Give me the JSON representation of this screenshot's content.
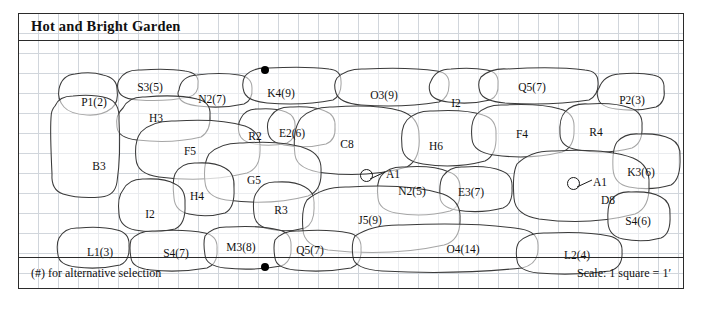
{
  "plan": {
    "title": "Hot and Bright Garden",
    "footer_note": "(#) for alternative selection",
    "footer_scale": "Scale: 1 square = 1′",
    "grid_square_px": 20,
    "border_color": "#2b2b2b",
    "grid_color": "#c9cfd6"
  },
  "beds": [
    {
      "label": "P1(2)",
      "cx": 75,
      "cy": 88
    },
    {
      "label": "S3(5)",
      "cx": 131,
      "cy": 73
    },
    {
      "label": "N2(7)",
      "cx": 193,
      "cy": 85
    },
    {
      "label": "K4(9)",
      "cx": 262,
      "cy": 79
    },
    {
      "label": "O3(9)",
      "cx": 365,
      "cy": 81
    },
    {
      "label": "I2",
      "cx": 437,
      "cy": 89
    },
    {
      "label": "Q5(7)",
      "cx": 513,
      "cy": 73
    },
    {
      "label": "P2(3)",
      "cx": 613,
      "cy": 86
    },
    {
      "label": "H3",
      "cx": 137,
      "cy": 104
    },
    {
      "label": "R2",
      "cx": 236,
      "cy": 122
    },
    {
      "label": "E2(6)",
      "cx": 273,
      "cy": 119
    },
    {
      "label": "C8",
      "cx": 328,
      "cy": 130
    },
    {
      "label": "H6",
      "cx": 417,
      "cy": 132
    },
    {
      "label": "F4",
      "cx": 503,
      "cy": 120
    },
    {
      "label": "R4",
      "cx": 577,
      "cy": 118
    },
    {
      "label": "F5",
      "cx": 171,
      "cy": 137
    },
    {
      "label": "B3",
      "cx": 80,
      "cy": 152
    },
    {
      "label": "G5",
      "cx": 235,
      "cy": 166
    },
    {
      "label": "K3(6)",
      "cx": 622,
      "cy": 158
    },
    {
      "label": "D8",
      "cx": 589,
      "cy": 186
    },
    {
      "label": "H4",
      "cx": 178,
      "cy": 182
    },
    {
      "label": "I2",
      "cx": 131,
      "cy": 200
    },
    {
      "label": "R3",
      "cx": 262,
      "cy": 196
    },
    {
      "label": "N2(5)",
      "cx": 393,
      "cy": 177
    },
    {
      "label": "E3(7)",
      "cx": 452,
      "cy": 178
    },
    {
      "label": "S4(6)",
      "cx": 619,
      "cy": 207
    },
    {
      "label": "J5(9)",
      "cx": 351,
      "cy": 206
    },
    {
      "label": "L1(3)",
      "cx": 81,
      "cy": 238
    },
    {
      "label": "S4(7)",
      "cx": 157,
      "cy": 239
    },
    {
      "label": "M3(8)",
      "cx": 222,
      "cy": 233
    },
    {
      "label": "Q5(7)",
      "cx": 291,
      "cy": 236
    },
    {
      "label": "O4(14)",
      "cx": 444,
      "cy": 235
    },
    {
      "label": "L2(4)",
      "cx": 558,
      "cy": 241
    }
  ],
  "accents": [
    {
      "label": "A1",
      "cx": 341,
      "cy": 155
    },
    {
      "label": "A1",
      "cx": 548,
      "cy": 163
    }
  ],
  "markers": [
    {
      "name": "top-center-dot",
      "cx": 246,
      "cy": 56
    },
    {
      "name": "bottom-center-dot",
      "cx": 246,
      "cy": 253
    }
  ]
}
